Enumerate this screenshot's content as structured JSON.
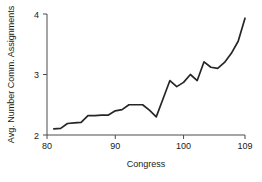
{
  "chart_data": {
    "type": "line",
    "title": "",
    "subtitle": "",
    "xlabel": "Congress",
    "ylabel": "Avg. Number Comm. Assignments",
    "xlim": [
      80,
      109
    ],
    "ylim": [
      2,
      4
    ],
    "xticks": [
      80,
      90,
      100,
      109
    ],
    "yticks": [
      2,
      3,
      4
    ],
    "xtick_labels": [
      "80",
      "90",
      "100",
      "109"
    ],
    "ytick_labels": [
      "2",
      "3",
      "4"
    ],
    "grid": false,
    "legend": null,
    "legend_position": "none",
    "line_color": "#262626",
    "x": [
      81,
      82,
      83,
      84,
      85,
      86,
      87,
      88,
      89,
      90,
      91,
      92,
      93,
      94,
      95,
      96,
      97,
      98,
      99,
      100,
      101,
      102,
      103,
      104,
      105,
      106,
      107,
      108,
      109
    ],
    "values": [
      2.1,
      2.11,
      2.19,
      2.2,
      2.21,
      2.32,
      2.32,
      2.33,
      2.33,
      2.4,
      2.42,
      2.5,
      2.5,
      2.5,
      2.41,
      2.3,
      2.6,
      2.9,
      2.8,
      2.87,
      3.0,
      2.9,
      3.21,
      3.12,
      3.1,
      3.2,
      3.35,
      3.55,
      3.93
    ],
    "series": [
      {
        "name": "Avg. Number Comm. Assignments",
        "values": [
          2.1,
          2.11,
          2.19,
          2.2,
          2.21,
          2.32,
          2.32,
          2.33,
          2.33,
          2.4,
          2.42,
          2.5,
          2.5,
          2.5,
          2.41,
          2.3,
          2.6,
          2.9,
          2.8,
          2.87,
          3.0,
          2.9,
          3.21,
          3.12,
          3.1,
          3.2,
          3.35,
          3.55,
          3.93
        ]
      }
    ],
    "annotations": []
  }
}
